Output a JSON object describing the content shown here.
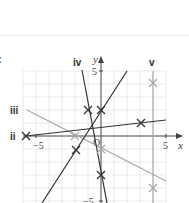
{
  "question": {
    "part_label": ":"
  },
  "graph": {
    "x_axis_label": "x",
    "y_axis_label": "y",
    "origin_label": "O",
    "ticks": {
      "x_neg": "−5",
      "x_pos": "5",
      "y_pos": "5",
      "y_neg": "−5"
    },
    "grid": {
      "xmin": -6,
      "xmax": 5,
      "ymin": -5,
      "ymax": 5,
      "step": 1
    },
    "colors": {
      "dark": "#333333",
      "light": "#a8a8a8",
      "grid": "#e4e4e4"
    },
    "lines": [
      {
        "id": "i",
        "label": "",
        "equation": "y = 1.5x + 2",
        "color": "dark",
        "points": [
          [
            -2,
            -1
          ],
          [
            0,
            2
          ]
        ]
      },
      {
        "id": "ii",
        "label": "ii",
        "equation": "y = (x + 6)/9",
        "color": "dark",
        "points": [
          [
            -6,
            0
          ],
          [
            3,
            1
          ]
        ]
      },
      {
        "id": "iii",
        "label": "iii",
        "equation": "y = -0.5x - 1",
        "color": "light",
        "points": [
          [
            -2,
            0
          ],
          [
            0,
            -1
          ]
        ]
      },
      {
        "id": "iv",
        "label": "iv",
        "equation": "y = -5x - 3",
        "color": "dark",
        "points": [
          [
            -1,
            2
          ],
          [
            0,
            -3
          ]
        ]
      },
      {
        "id": "v",
        "label": "v",
        "equation": "x = 4",
        "color": "light",
        "points": [
          [
            4,
            4
          ],
          [
            4,
            -4
          ]
        ]
      }
    ]
  }
}
